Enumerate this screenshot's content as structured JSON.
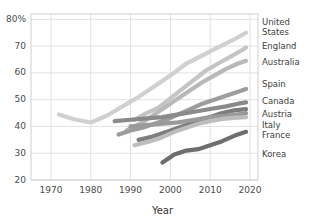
{
  "chart_data": {
    "type": "line",
    "title": "",
    "xlabel": "Year",
    "ylabel": "",
    "xlim": [
      1965,
      2022
    ],
    "ylim": [
      20,
      82
    ],
    "grid": true,
    "legend_position": "right",
    "xticks": [
      1970,
      1980,
      1990,
      2000,
      2010,
      2020
    ],
    "xtick_labels": [
      "1970",
      "1980",
      "1990",
      "2000",
      "2010",
      "2020"
    ],
    "yticks": [
      20,
      30,
      40,
      50,
      60,
      70,
      80
    ],
    "ytick_labels": [
      "20",
      "30",
      "40",
      "50",
      "60",
      "70",
      "80%"
    ],
    "series": [
      {
        "name": "United States",
        "color": "#d0d0d0",
        "points": [
          [
            1972,
            44.5
          ],
          [
            1976,
            42.6
          ],
          [
            1980,
            41.5
          ],
          [
            1984,
            44.0
          ],
          [
            1988,
            47.5
          ],
          [
            1992,
            51.0
          ],
          [
            1996,
            55.0
          ],
          [
            2000,
            59.0
          ],
          [
            2004,
            63.5
          ],
          [
            2008,
            66.5
          ],
          [
            2012,
            69.5
          ],
          [
            2016,
            72.5
          ],
          [
            2019,
            75.0
          ]
        ]
      },
      {
        "name": "England",
        "color": "#c4c4c4",
        "points": [
          [
            1991,
            42.5
          ],
          [
            1994,
            45.0
          ],
          [
            1997,
            47.0
          ],
          [
            2000,
            50.5
          ],
          [
            2003,
            54.0
          ],
          [
            2006,
            57.5
          ],
          [
            2009,
            61.0
          ],
          [
            2012,
            63.5
          ],
          [
            2015,
            66.0
          ],
          [
            2018,
            68.5
          ],
          [
            2019,
            69.5
          ]
        ]
      },
      {
        "name": "Australia",
        "color": "#b8b8b8",
        "points": [
          [
            1989,
            38.5
          ],
          [
            1993,
            41.5
          ],
          [
            1996,
            44.5
          ],
          [
            1999,
            47.5
          ],
          [
            2002,
            50.5
          ],
          [
            2005,
            53.5
          ],
          [
            2008,
            56.5
          ],
          [
            2011,
            59.0
          ],
          [
            2014,
            61.5
          ],
          [
            2017,
            63.5
          ],
          [
            2019,
            64.5
          ]
        ]
      },
      {
        "name": "Spain",
        "color": "#9c9c9c",
        "points": [
          [
            1987,
            37.0
          ],
          [
            1990,
            38.5
          ],
          [
            1993,
            39.5
          ],
          [
            1996,
            41.0
          ],
          [
            1999,
            42.5
          ],
          [
            2002,
            44.5
          ],
          [
            2005,
            46.5
          ],
          [
            2008,
            48.5
          ],
          [
            2011,
            50.0
          ],
          [
            2014,
            51.5
          ],
          [
            2017,
            53.0
          ],
          [
            2019,
            54.0
          ]
        ]
      },
      {
        "name": "Canada",
        "color": "#8a8a8a",
        "points": [
          [
            1986,
            42.0
          ],
          [
            1990,
            42.5
          ],
          [
            1994,
            43.0
          ],
          [
            1998,
            43.5
          ],
          [
            2002,
            44.5
          ],
          [
            2006,
            45.5
          ],
          [
            2010,
            46.5
          ],
          [
            2014,
            47.5
          ],
          [
            2017,
            48.5
          ],
          [
            2019,
            49.0
          ]
        ]
      },
      {
        "name": "Austria",
        "color": "#7d7d7d",
        "points": [
          [
            1992,
            35.0
          ],
          [
            1995,
            36.0
          ],
          [
            1998,
            37.5
          ],
          [
            2001,
            39.0
          ],
          [
            2004,
            40.5
          ],
          [
            2007,
            42.0
          ],
          [
            2010,
            43.5
          ],
          [
            2013,
            45.0
          ],
          [
            2016,
            46.0
          ],
          [
            2019,
            46.5
          ]
        ]
      },
      {
        "name": "Italy",
        "color": "#9a9a9a",
        "points": [
          [
            1990,
            40.0
          ],
          [
            1994,
            40.5
          ],
          [
            1998,
            41.0
          ],
          [
            2002,
            41.5
          ],
          [
            2006,
            42.5
          ],
          [
            2010,
            43.5
          ],
          [
            2014,
            44.0
          ],
          [
            2017,
            44.5
          ],
          [
            2019,
            45.0
          ]
        ]
      },
      {
        "name": "France",
        "color": "#bdbdbd",
        "points": [
          [
            1991,
            33.0
          ],
          [
            1995,
            34.5
          ],
          [
            1998,
            36.0
          ],
          [
            2001,
            38.0
          ],
          [
            2004,
            39.5
          ],
          [
            2007,
            41.0
          ],
          [
            2010,
            42.0
          ],
          [
            2013,
            42.8
          ],
          [
            2016,
            43.2
          ],
          [
            2019,
            43.5
          ]
        ]
      },
      {
        "name": "Korea",
        "color": "#6e6e6e",
        "points": [
          [
            1998,
            26.5
          ],
          [
            2001,
            29.5
          ],
          [
            2004,
            31.0
          ],
          [
            2007,
            31.5
          ],
          [
            2010,
            33.0
          ],
          [
            2013,
            34.5
          ],
          [
            2016,
            36.5
          ],
          [
            2019,
            38.0
          ]
        ]
      }
    ]
  },
  "legend": {
    "entries": [
      {
        "label": "United States",
        "top": 18,
        "two_line": true
      },
      {
        "label": "England",
        "top": 42,
        "two_line": false
      },
      {
        "label": "Australia",
        "top": 58,
        "two_line": false
      },
      {
        "label": "Spain",
        "top": 80,
        "two_line": false
      },
      {
        "label": "Canada",
        "top": 97,
        "two_line": false
      },
      {
        "label": "Austria",
        "top": 110,
        "two_line": false
      },
      {
        "label": "Italy",
        "top": 121,
        "two_line": false
      },
      {
        "label": "France",
        "top": 131,
        "two_line": false
      },
      {
        "label": "Korea",
        "top": 150,
        "two_line": false
      }
    ]
  },
  "style": {
    "grid_color": "#e2e2e2",
    "axis_color": "#cfcfcf",
    "text_color": "#3c3c3c",
    "background": "#ffffff"
  }
}
